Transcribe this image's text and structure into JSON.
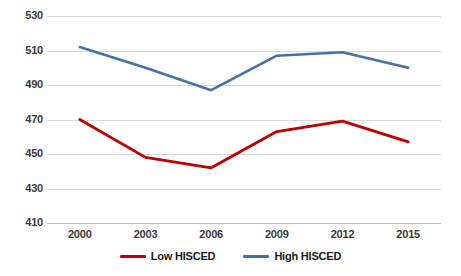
{
  "chart_data": {
    "type": "line",
    "title": "",
    "xlabel": "",
    "ylabel": "",
    "categories": [
      "2000",
      "2003",
      "2006",
      "2009",
      "2012",
      "2015"
    ],
    "x": [
      2000,
      2003,
      2006,
      2009,
      2012,
      2015
    ],
    "series": [
      {
        "name": "Low HISCED",
        "color": "#C00000",
        "values": [
          470,
          448,
          442,
          463,
          469,
          457
        ]
      },
      {
        "name": "High HISCED",
        "color": "#4472A8",
        "values": [
          512,
          500,
          487,
          507,
          509,
          500
        ]
      }
    ],
    "ylim": [
      410,
      530
    ],
    "ytick_labels": [
      "530",
      "510",
      "490",
      "470",
      "450",
      "430",
      "410"
    ],
    "ytick_values": [
      530,
      510,
      490,
      470,
      450,
      430,
      410
    ],
    "xtick_labels": [
      "2000",
      "2003",
      "2006",
      "2009",
      "2012",
      "2015"
    ],
    "grid": "horizontal",
    "legend_position": "bottom"
  },
  "legend": {
    "entries": [
      {
        "label": "Low HISCED",
        "color": "#C00000",
        "icon": "line-swatch-red"
      },
      {
        "label": "High HISCED",
        "color": "#4472A8",
        "icon": "line-swatch-blue"
      }
    ]
  },
  "colors": {
    "low_hisced": "#C00000",
    "high_hisced": "#4472A8",
    "gridline": "#D9D9D9",
    "axis": "#BFBFBF",
    "tick_text": "#3A3A3A",
    "background": "#FFFFFF"
  }
}
